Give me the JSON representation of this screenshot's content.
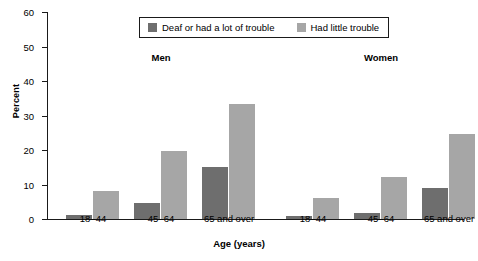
{
  "chart_data": {
    "type": "bar",
    "title": "",
    "xlabel": "Age (years)",
    "ylabel": "Percent",
    "ylim": [
      0,
      60
    ],
    "yticks": [
      0,
      10,
      20,
      30,
      40,
      50,
      60
    ],
    "grid": false,
    "legend_position": "top-center",
    "groups": [
      "Men",
      "Women"
    ],
    "categories": [
      "18–44",
      "45–64",
      "65 and over"
    ],
    "series": [
      {
        "name": "Deaf or had a lot of trouble",
        "color": "#6e6e6e",
        "values_by_group": {
          "Men": [
            1.2,
            4.5,
            15.0
          ],
          "Women": [
            0.8,
            1.8,
            9.0
          ]
        }
      },
      {
        "name": "Had little trouble",
        "color": "#a6a6a6",
        "values_by_group": {
          "Men": [
            8.0,
            19.8,
            33.2
          ],
          "Women": [
            6.0,
            12.2,
            24.6
          ]
        }
      }
    ],
    "bars": [
      {
        "group": "Men",
        "category": "18–44",
        "series": "Deaf or had a lot of trouble",
        "value": 1.2,
        "color": "#6e6e6e",
        "x": 18,
        "w": 26
      },
      {
        "group": "Men",
        "category": "18–44",
        "series": "Had little trouble",
        "value": 8.0,
        "color": "#a6a6a6",
        "x": 45,
        "w": 26
      },
      {
        "group": "Men",
        "category": "45–64",
        "series": "Deaf or had a lot of trouble",
        "value": 4.5,
        "color": "#6e6e6e",
        "x": 86,
        "w": 26
      },
      {
        "group": "Men",
        "category": "45–64",
        "series": "Had little trouble",
        "value": 19.8,
        "color": "#a6a6a6",
        "x": 113,
        "w": 26
      },
      {
        "group": "Men",
        "category": "65 and over",
        "series": "Deaf or had a lot of trouble",
        "value": 15.0,
        "color": "#6e6e6e",
        "x": 154,
        "w": 26
      },
      {
        "group": "Men",
        "category": "65 and over",
        "series": "Had little trouble",
        "value": 33.2,
        "color": "#a6a6a6",
        "x": 181,
        "w": 26
      },
      {
        "group": "Women",
        "category": "18–44",
        "series": "Deaf or had a lot of trouble",
        "value": 0.8,
        "color": "#6e6e6e",
        "x": 238,
        "w": 26
      },
      {
        "group": "Women",
        "category": "18–44",
        "series": "Had little trouble",
        "value": 6.0,
        "color": "#a6a6a6",
        "x": 265,
        "w": 26
      },
      {
        "group": "Women",
        "category": "45–64",
        "series": "Deaf or had a lot of trouble",
        "value": 1.8,
        "color": "#6e6e6e",
        "x": 306,
        "w": 26
      },
      {
        "group": "Women",
        "category": "45–64",
        "series": "Had little trouble",
        "value": 12.2,
        "color": "#a6a6a6",
        "x": 333,
        "w": 26
      },
      {
        "group": "Women",
        "category": "65 and over",
        "series": "Deaf or had a lot of trouble",
        "value": 9.0,
        "color": "#6e6e6e",
        "x": 374,
        "w": 26
      },
      {
        "group": "Women",
        "category": "65 and over",
        "series": "Had little trouble",
        "value": 24.6,
        "color": "#a6a6a6",
        "x": 401,
        "w": 26
      }
    ],
    "category_label_positions": [
      45,
      113,
      181,
      265,
      333,
      401
    ],
    "group_label_positions": [
      113,
      333
    ]
  },
  "legend": {
    "items": [
      {
        "label": "Deaf or had a lot of trouble",
        "color": "#6e6e6e"
      },
      {
        "label": "Had little trouble",
        "color": "#a6a6a6"
      }
    ]
  },
  "axis_colors": {
    "axis_line": "#1a1a1a",
    "background": "#ffffff"
  }
}
